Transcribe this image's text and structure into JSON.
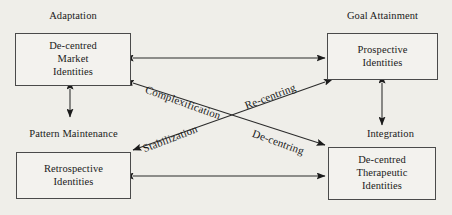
{
  "diagram": {
    "title_absent": true,
    "background_color": "#efeee9",
    "line_color": "#2b2b2b",
    "box_border_color": "#4a4a4a",
    "function_labels": {
      "adaptation": "Adaptation",
      "goal_attainment": "Goal Attainment",
      "pattern_maintenance": "Pattern Maintenance",
      "integration": "Integration"
    },
    "nodes": {
      "top_left": {
        "lines": [
          "De-centred",
          "Market",
          "Identities"
        ]
      },
      "top_right": {
        "lines": [
          "Prospective",
          "Identities"
        ]
      },
      "bottom_left": {
        "lines": [
          "Retrospective",
          "Identities"
        ]
      },
      "bottom_right": {
        "lines": [
          "De-centred",
          "Therapeutic",
          "Identities"
        ]
      }
    },
    "edge_labels": {
      "complexification": "Complexification",
      "re_centring": "Re-centring",
      "stabilization": "Stabilization",
      "de_centring": "De-centring"
    },
    "connectors": [
      {
        "name": "top-horizontal",
        "from": "top_left",
        "to": "top_right",
        "heads": "both",
        "label": ""
      },
      {
        "name": "bottom-horizontal",
        "from": "bottom_left",
        "to": "bottom_right",
        "heads": "both",
        "label": ""
      },
      {
        "name": "left-vertical",
        "from": "top_left",
        "to": "bottom_left",
        "heads": "both",
        "label": ""
      },
      {
        "name": "right-vertical",
        "from": "top_right",
        "to": "bottom_right",
        "heads": "both",
        "label": ""
      },
      {
        "name": "diagonal-nwse",
        "from": "top_left",
        "to": "bottom_right",
        "heads": "both",
        "label": "Complexification / De-centring"
      },
      {
        "name": "diagonal-nesw",
        "from": "top_right",
        "to": "bottom_left",
        "heads": "both",
        "label": "Re-centring / Stabilization"
      }
    ]
  }
}
